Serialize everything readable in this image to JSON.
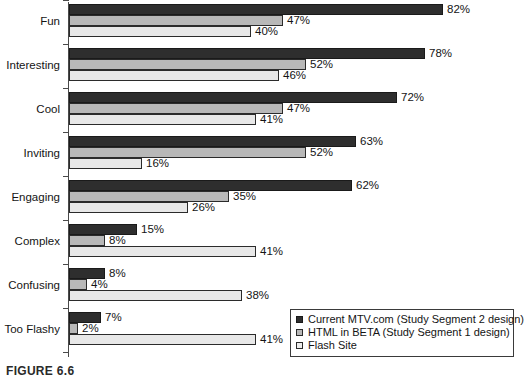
{
  "caption": "FIGURE 6.6",
  "legend": {
    "position": "bottom-right",
    "items": [
      {
        "label": "Current MTV.com (Study Segment 2 design)",
        "swatch": "dark-square-icon",
        "color": "#2e2e2e"
      },
      {
        "label": "HTML in BETA (Study Segment 1 design)",
        "swatch": "gray-square-icon",
        "color": "#b8b8b8"
      },
      {
        "label": "Flash Site",
        "swatch": "light-square-icon",
        "color": "#ededed"
      }
    ]
  },
  "chart_data": {
    "type": "bar",
    "orientation": "horizontal",
    "title": "",
    "xlabel": "",
    "ylabel": "",
    "xlim": [
      0,
      86
    ],
    "grid": false,
    "legend_position": "bottom-right",
    "value_suffix": "%",
    "categories": [
      "Fun",
      "Interesting",
      "Cool",
      "Inviting",
      "Engaging",
      "Complex",
      "Confusing",
      "Too Flashy"
    ],
    "series": [
      {
        "name": "Current MTV.com (Study Segment 2 design)",
        "color": "#2e2e2e",
        "values": [
          82,
          78,
          72,
          63,
          62,
          15,
          8,
          7
        ],
        "labels": [
          "82%",
          "78%",
          "72%",
          "63%",
          "62%",
          "15%",
          "8%",
          "7%"
        ]
      },
      {
        "name": "HTML in BETA (Study Segment 1 design)",
        "color": "#b8b8b8",
        "values": [
          47,
          52,
          47,
          52,
          35,
          8,
          4,
          2
        ],
        "labels": [
          "47%",
          "52%",
          "47%",
          "52%",
          "35%",
          "8%",
          "4%",
          "2%"
        ]
      },
      {
        "name": "Flash Site",
        "color": "#e8e8e8",
        "values": [
          40,
          46,
          41,
          16,
          26,
          41,
          38,
          41
        ],
        "labels": [
          "40%",
          "46%",
          "41%",
          "16%",
          "26%",
          "41%",
          "38%",
          "41%"
        ]
      }
    ]
  }
}
